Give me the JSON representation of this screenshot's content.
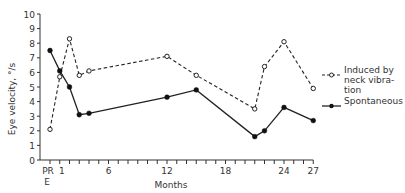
{
  "chart_data": {
    "type": "line",
    "title": "",
    "xlabel": "Months",
    "ylabel": "Eye velocity, °/s",
    "ylim": [
      0,
      10
    ],
    "xlim": [
      -1,
      27
    ],
    "yticks": [
      0,
      1,
      2,
      3,
      4,
      5,
      6,
      7,
      8,
      9,
      10
    ],
    "xtick_labels": [
      {
        "x": 0,
        "label": "PR",
        "sublabel": "E"
      },
      {
        "x": 1,
        "label": "1"
      },
      {
        "x": 6,
        "label": "6"
      },
      {
        "x": 12,
        "label": "12"
      },
      {
        "x": 18,
        "label": "18"
      },
      {
        "x": 24,
        "label": "24"
      },
      {
        "x": 27,
        "label": "27"
      }
    ],
    "grid": false,
    "legend_position": "right",
    "series": [
      {
        "name": "Induced by neck vibration",
        "legend_lines": [
          "Induced  by",
          "neck vibra-",
          "tion"
        ],
        "style": "dashed",
        "marker": "open-circle",
        "x": [
          0,
          1,
          2,
          3,
          4,
          12,
          15,
          21,
          22,
          24,
          27
        ],
        "values": [
          2.1,
          5.7,
          8.3,
          5.8,
          6.1,
          7.1,
          5.8,
          3.5,
          6.4,
          8.1,
          4.9
        ]
      },
      {
        "name": "Spontaneous",
        "legend_lines": [
          "Spontaneous"
        ],
        "style": "solid",
        "marker": "filled-circle",
        "x": [
          0,
          1,
          2,
          3,
          4,
          12,
          15,
          21,
          22,
          24,
          27
        ],
        "values": [
          7.5,
          6.1,
          5.0,
          3.1,
          3.2,
          4.3,
          4.8,
          1.6,
          2.0,
          3.6,
          2.7
        ]
      }
    ]
  }
}
